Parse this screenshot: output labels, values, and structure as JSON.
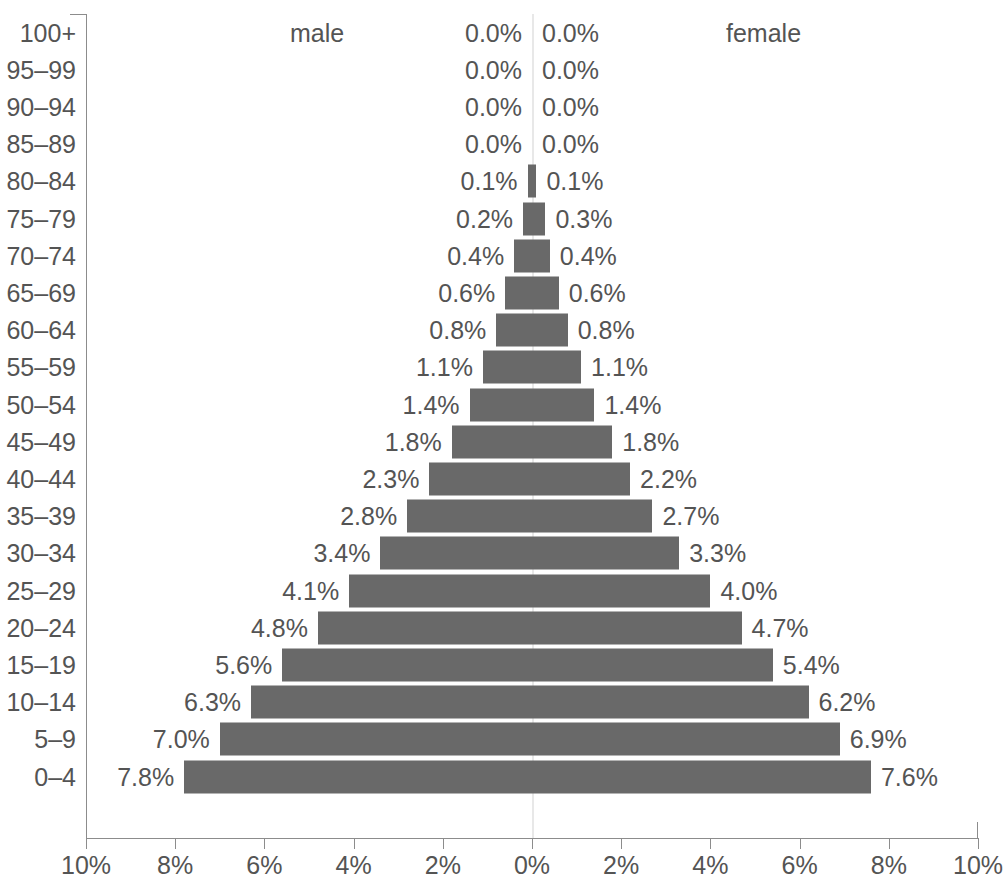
{
  "chart_data": {
    "type": "bar",
    "subtype": "population-pyramid",
    "title": "",
    "xlabel": "",
    "ylabel": "",
    "grid": false,
    "legend_position": "top",
    "categories": [
      "100+",
      "95–99",
      "90–94",
      "85–89",
      "80–84",
      "75–79",
      "70–74",
      "65–69",
      "60–64",
      "55–59",
      "50–54",
      "45–49",
      "40–44",
      "35–39",
      "30–34",
      "25–29",
      "20–24",
      "15–19",
      "10–14",
      "5–9",
      "0–4"
    ],
    "series": [
      {
        "name": "male",
        "side": "left",
        "values": [
          0.0,
          0.0,
          0.0,
          0.0,
          0.1,
          0.2,
          0.4,
          0.6,
          0.8,
          1.1,
          1.4,
          1.8,
          2.3,
          2.8,
          3.4,
          4.1,
          4.8,
          5.6,
          6.3,
          7.0,
          7.8
        ],
        "labels": [
          "0.0%",
          "0.0%",
          "0.0%",
          "0.0%",
          "0.1%",
          "0.2%",
          "0.4%",
          "0.6%",
          "0.8%",
          "1.1%",
          "1.4%",
          "1.8%",
          "2.3%",
          "2.8%",
          "3.4%",
          "4.1%",
          "4.8%",
          "5.6%",
          "6.3%",
          "7.0%",
          "7.8%"
        ]
      },
      {
        "name": "female",
        "side": "right",
        "values": [
          0.0,
          0.0,
          0.0,
          0.0,
          0.1,
          0.3,
          0.4,
          0.6,
          0.8,
          1.1,
          1.4,
          1.8,
          2.2,
          2.7,
          3.3,
          4.0,
          4.7,
          5.4,
          6.2,
          6.9,
          7.6
        ],
        "labels": [
          "0.0%",
          "0.0%",
          "0.0%",
          "0.0%",
          "0.1%",
          "0.3%",
          "0.4%",
          "0.6%",
          "0.8%",
          "1.1%",
          "1.4%",
          "1.8%",
          "2.2%",
          "2.7%",
          "3.3%",
          "4.0%",
          "4.7%",
          "5.4%",
          "6.2%",
          "6.9%",
          "7.6%"
        ]
      }
    ],
    "xlim": [
      -10,
      10
    ],
    "xticks": [
      -10,
      -8,
      -6,
      -4,
      -2,
      0,
      2,
      4,
      6,
      8,
      10
    ],
    "xtick_labels": [
      "10%",
      "8%",
      "6%",
      "4%",
      "2%",
      "0%",
      "2%",
      "4%",
      "6%",
      "8%",
      "10%"
    ],
    "colors": {
      "bar": "#696969",
      "text": "#545454",
      "axis": "#8c8c8c",
      "center_line": "#e8e8e8",
      "background": "#ffffff"
    }
  },
  "legend": {
    "male": "male",
    "female": "female"
  }
}
